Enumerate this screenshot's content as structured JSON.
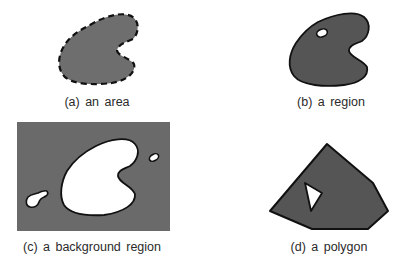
{
  "figure": {
    "panels": [
      {
        "id": "a",
        "caption": "(a) an area",
        "shape": "area",
        "fill": "#6e6e6e",
        "stroke": "dashed"
      },
      {
        "id": "b",
        "caption": "(b) a region",
        "shape": "region",
        "fill": "#555555",
        "stroke": "solid",
        "holes": 1
      },
      {
        "id": "c",
        "caption": "(c) a background region",
        "shape": "background-region",
        "fill": "#6a6a6a",
        "holes": 3
      },
      {
        "id": "d",
        "caption": "(d) a polygon",
        "shape": "polygon",
        "fill": "#555555",
        "stroke": "solid",
        "holes": 1
      }
    ],
    "colors": {
      "background": "#ffffff",
      "stroke": "#111111",
      "hole": "#ffffff"
    }
  }
}
